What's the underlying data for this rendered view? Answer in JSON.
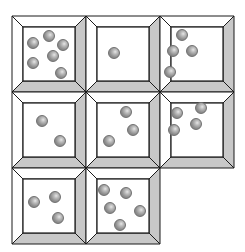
{
  "diagram": {
    "grid": {
      "rows": 3,
      "cols": 3,
      "origin": [
        12,
        16
      ],
      "cell_size": [
        74,
        76
      ]
    },
    "colors": {
      "bevel_shade": "#c8c8c8",
      "bevel_light": "#ffffff",
      "line": "#1a1a1a",
      "ball": "#8f8f8f"
    },
    "cells": [
      {
        "row": 0,
        "col": 0,
        "count": 6,
        "balls": [
          [
            21,
            27
          ],
          [
            37,
            20
          ],
          [
            51,
            29
          ],
          [
            41,
            40
          ],
          [
            21,
            47
          ],
          [
            49,
            57
          ]
        ]
      },
      {
        "row": 0,
        "col": 1,
        "count": 1,
        "balls": [
          [
            28,
            37
          ]
        ]
      },
      {
        "row": 0,
        "col": 2,
        "count": 4,
        "balls": [
          [
            22,
            19
          ],
          [
            13,
            35
          ],
          [
            32,
            35
          ],
          [
            10,
            56
          ]
        ]
      },
      {
        "row": 1,
        "col": 0,
        "count": 2,
        "balls": [
          [
            30,
            29
          ],
          [
            48,
            49
          ]
        ]
      },
      {
        "row": 1,
        "col": 1,
        "count": 3,
        "balls": [
          [
            40,
            20
          ],
          [
            47,
            38
          ],
          [
            23,
            49
          ]
        ]
      },
      {
        "row": 1,
        "col": 2,
        "count": 4,
        "balls": [
          [
            17,
            21
          ],
          [
            41,
            16
          ],
          [
            36,
            32
          ],
          [
            14,
            38
          ]
        ]
      },
      {
        "row": 2,
        "col": 0,
        "count": 3,
        "balls": [
          [
            22,
            34
          ],
          [
            43,
            29
          ],
          [
            46,
            50
          ]
        ]
      },
      {
        "row": 2,
        "col": 1,
        "count": 5,
        "balls": [
          [
            18,
            22
          ],
          [
            40,
            25
          ],
          [
            24,
            40
          ],
          [
            54,
            43
          ],
          [
            34,
            57
          ]
        ]
      }
    ]
  }
}
